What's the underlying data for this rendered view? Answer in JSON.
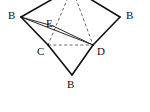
{
  "figure": {
    "background_color": "#ffffff",
    "stroke_color": "#111111",
    "hidden_edge_color": "#555555",
    "labels": [
      {
        "text": "B",
        "name": "vertex-label-b-left",
        "x": 8,
        "y": 10
      },
      {
        "text": "B",
        "name": "vertex-label-b-right",
        "x": 126,
        "y": 10
      },
      {
        "text": "B",
        "name": "vertex-label-b-bottom",
        "x": 67,
        "y": 79
      },
      {
        "text": "C",
        "name": "vertex-label-c",
        "x": 37,
        "y": 46
      },
      {
        "text": "D",
        "name": "vertex-label-d",
        "x": 97,
        "y": 46
      },
      {
        "text": "E",
        "name": "vertex-label-e",
        "x": 46,
        "y": 18
      }
    ],
    "vertices": {
      "apex": {
        "x": 72,
        "y": -12
      },
      "b_left": {
        "x": 21,
        "y": 17
      },
      "b_right": {
        "x": 120,
        "y": 17
      },
      "b_bottom": {
        "x": 72,
        "y": 75
      },
      "c": {
        "x": 48,
        "y": 45
      },
      "d": {
        "x": 93,
        "y": 45
      },
      "e": {
        "x": 53,
        "y": 26
      }
    },
    "edges_solid": [
      {
        "name": "edge-apex-b-left",
        "x1": 72,
        "y1": -12,
        "x2": 21,
        "y2": 17
      },
      {
        "name": "edge-apex-b-right",
        "x1": 72,
        "y1": -12,
        "x2": 120,
        "y2": 17
      },
      {
        "name": "edge-b-left-c",
        "x1": 21,
        "y1": 17,
        "x2": 48,
        "y2": 45
      },
      {
        "name": "edge-b-right-d",
        "x1": 120,
        "y1": 17,
        "x2": 93,
        "y2": 45
      },
      {
        "name": "edge-c-b-bottom",
        "x1": 48,
        "y1": 45,
        "x2": 72,
        "y2": 75
      },
      {
        "name": "edge-d-b-bottom",
        "x1": 93,
        "y1": 45,
        "x2": 72,
        "y2": 75
      }
    ],
    "edges_thin": [
      {
        "name": "edge-b-left-d",
        "x1": 21,
        "y1": 17,
        "x2": 93,
        "y2": 45
      },
      {
        "name": "edge-b-left-e",
        "x1": 21,
        "y1": 17,
        "x2": 53,
        "y2": 26
      },
      {
        "name": "edge-e-d",
        "x1": 53,
        "y1": 26,
        "x2": 93,
        "y2": 45
      }
    ],
    "edges_dashed": [
      {
        "name": "hidden-edge-apex-c",
        "x1": 72,
        "y1": -12,
        "x2": 48,
        "y2": 45
      },
      {
        "name": "hidden-edge-apex-d",
        "x1": 72,
        "y1": -12,
        "x2": 93,
        "y2": 45
      },
      {
        "name": "hidden-edge-c-d",
        "x1": 48,
        "y1": 45,
        "x2": 93,
        "y2": 45
      }
    ]
  }
}
